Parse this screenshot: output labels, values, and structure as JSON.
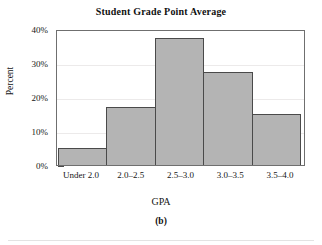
{
  "chart_data": {
    "type": "bar",
    "title": "Student Grade Point Average",
    "xlabel": "GPA",
    "ylabel": "Percent",
    "categories": [
      "Under 2.0",
      "2.0–2.5",
      "2.5–3.0",
      "3.0–3.5",
      "3.5–4.0"
    ],
    "values": [
      5,
      17,
      37.5,
      27.5,
      15
    ],
    "ylim": [
      0,
      40
    ],
    "ytick_labels": [
      "0%",
      "10%",
      "20%",
      "30%",
      "40%"
    ],
    "ytick_values": [
      0,
      10,
      20,
      30,
      40
    ],
    "yminor_tick_values": [
      5,
      15,
      25,
      35
    ],
    "grid": true,
    "grid_axis": "y",
    "legend": "none",
    "bar_fill_color": "#b4b4b4",
    "bar_edge_color": "#4a4a4a",
    "gridline_color": "#eceaea",
    "axis_color": "#4a4a4a",
    "background_color": "#ffffff"
  },
  "figure": {
    "panel_caption": "(b)"
  }
}
